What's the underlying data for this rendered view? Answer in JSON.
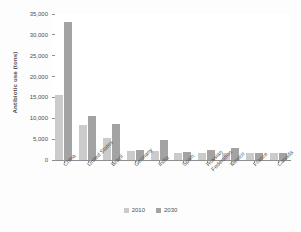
{
  "chart_data": {
    "type": "bar",
    "title": "",
    "xlabel": "",
    "ylabel": "Antibiotic use (tons)",
    "ylim": [
      0,
      35000
    ],
    "ytick_labels": [
      "35,000",
      "30,000",
      "25,000",
      "20,000",
      "15,000",
      "10,000",
      "5,000",
      "0"
    ],
    "ytick_values": [
      35000,
      30000,
      25000,
      20000,
      15000,
      10000,
      5000,
      0
    ],
    "grid": false,
    "legend_position": "bottom-center",
    "categories": [
      "China",
      "United States",
      "Brazil",
      "Germany",
      "India",
      "Spain",
      "Russian Federation",
      "Mexico",
      "France",
      "Canada"
    ],
    "series": [
      {
        "name": "2010",
        "color": "#cbcbcb",
        "values": [
          15500,
          8400,
          5200,
          2100,
          2100,
          1800,
          1800,
          1700,
          1700,
          1600
        ]
      },
      {
        "name": "2030",
        "color": "#a3a3a3",
        "values": [
          33200,
          10500,
          8600,
          2300,
          4700,
          2000,
          2300,
          2900,
          1800,
          1700
        ]
      }
    ]
  },
  "axis": {
    "y_title": "Antibiotic use (tons)"
  },
  "legend": {
    "items": [
      {
        "label": "2010",
        "color": "#cbcbcb"
      },
      {
        "label": "2030",
        "color": "#a3a3a3"
      }
    ]
  },
  "colors": {
    "series_2010": "#cbcbcb",
    "series_2030": "#a3a3a3",
    "axis": "#8f8f8f",
    "text": "#4f4f4f",
    "background": "#fdfdfd"
  }
}
